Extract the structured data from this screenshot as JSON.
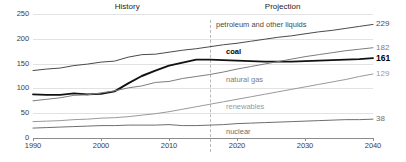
{
  "chart_data": {
    "type": "line",
    "title": "",
    "xlabel": "",
    "ylabel": "",
    "xlim": [
      1990,
      2040
    ],
    "ylim": [
      0,
      250
    ],
    "grid": true,
    "legend_position": "inline-series-labels",
    "x_ticks": [
      "1990",
      "2000",
      "2010",
      "2020",
      "2030",
      "2040"
    ],
    "y_ticks": [
      "0",
      "50",
      "100",
      "150",
      "200",
      "250"
    ],
    "annotations": {
      "history_label": "History",
      "projection_label": "Projection",
      "divider_year": 2016
    },
    "x": [
      1990,
      1992,
      1994,
      1996,
      1998,
      2000,
      2002,
      2004,
      2006,
      2008,
      2010,
      2012,
      2014,
      2016,
      2018,
      2020,
      2022,
      2024,
      2026,
      2028,
      2030,
      2032,
      2034,
      2036,
      2038,
      2040
    ],
    "series": [
      {
        "name": "petroleum and other liquids",
        "label": "petroleum and other liquids",
        "end_value": "229",
        "color": "#4a4a4a",
        "bold": false,
        "values": [
          136,
          139,
          141,
          146,
          149,
          153,
          155,
          163,
          168,
          169,
          173,
          177,
          180,
          184,
          188,
          191,
          195,
          199,
          203,
          206,
          210,
          214,
          217,
          221,
          225,
          229
        ]
      },
      {
        "name": "coal",
        "label": "coal",
        "end_value": "161",
        "color": "#111111",
        "bold": true,
        "values": [
          88,
          87,
          87,
          90,
          88,
          89,
          94,
          110,
          125,
          136,
          146,
          152,
          158,
          158,
          157,
          156,
          155,
          154,
          154,
          154,
          155,
          156,
          157,
          158,
          159,
          161
        ]
      },
      {
        "name": "natural gas",
        "label": "natural gas",
        "end_value": "182",
        "color": "#7d7d7d",
        "bold": false,
        "values": [
          75,
          78,
          81,
          86,
          87,
          91,
          95,
          101,
          105,
          112,
          114,
          120,
          124,
          128,
          133,
          139,
          144,
          149,
          154,
          159,
          164,
          168,
          172,
          176,
          179,
          182
        ]
      },
      {
        "name": "renewables",
        "label": "renewables",
        "end_value": "129",
        "color": "#9a9a9a",
        "bold": false,
        "values": [
          33,
          34,
          35,
          37,
          38,
          40,
          41,
          43,
          46,
          49,
          53,
          58,
          63,
          68,
          73,
          78,
          83,
          88,
          93,
          98,
          103,
          108,
          113,
          118,
          124,
          129
        ]
      },
      {
        "name": "nuclear",
        "label": "nuclear",
        "end_value": "38",
        "color": "#6e6e6e",
        "bold": false,
        "values": [
          20,
          21,
          22,
          23,
          24,
          25,
          25,
          26,
          26,
          26,
          27,
          25,
          25,
          26,
          27,
          29,
          30,
          31,
          32,
          33,
          34,
          35,
          36,
          37,
          37,
          38
        ]
      }
    ]
  },
  "colors": {
    "grid": "#e2e2e2",
    "axis": "#8c8c8c",
    "divider": "#b9b9b9",
    "text": "#3c3c3c"
  }
}
